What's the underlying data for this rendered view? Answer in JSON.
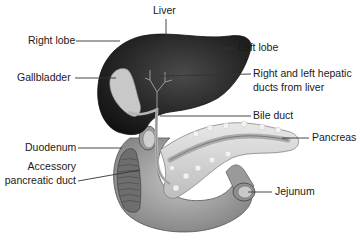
{
  "diagram": {
    "labels": {
      "liver": "Liver",
      "right_lobe": "Right lobe",
      "left_lobe": "Left lobe",
      "gallbladder": "Gallbladder",
      "hepatic_ducts_line1": "Right and left hepatic",
      "hepatic_ducts_line2": "ducts from liver",
      "bile_duct": "Bile duct",
      "duodenum": "Duodenum",
      "accessory_duct_line1": "Accessory",
      "accessory_duct_line2": "pancreatic duct",
      "pancreas": "Pancreas",
      "jejunum": "Jejunum"
    },
    "colors": {
      "liver": "#2a2a2a",
      "liver_highlight": "#5a5a5a",
      "gallbladder": "#c8c8c8",
      "duodenum": "#a9a9a9",
      "pancreas": "#d9d9d9",
      "pancreatic_duct": "#9a9a9a",
      "leader_line": "#333333",
      "text": "#1a1a1a"
    }
  }
}
